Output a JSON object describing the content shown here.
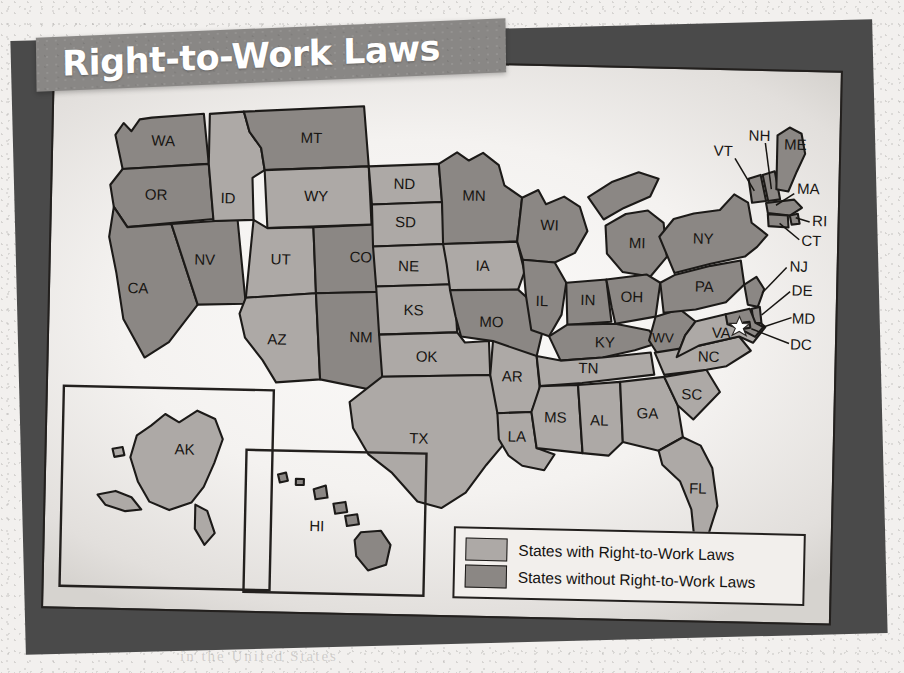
{
  "title": {
    "text": "Right-to-Work Laws"
  },
  "colors": {
    "with_rtw_fill": "#ada9a6",
    "without_rtw_fill": "#8b8784",
    "banner": "#898785",
    "outline": "#1c1a18",
    "page": "#f4f2f0",
    "shadow_sheet": "#4a4a4a"
  },
  "legend": {
    "items": [
      {
        "swatch": "with",
        "label": "States with Right-to-Work Laws"
      },
      {
        "swatch": "without",
        "label": "States without Right-to-Work Laws"
      }
    ]
  },
  "insets": {
    "alaska": {
      "label": "AK",
      "status": "with"
    },
    "hawaii": {
      "label": "HI",
      "status": "without"
    }
  },
  "map_data": {
    "type": "choropleth-categorical",
    "title": "Right-to-Work Laws",
    "region": "United States",
    "categories": [
      "States with Right-to-Work Laws",
      "States without Right-to-Work Laws"
    ],
    "marker": {
      "type": "star",
      "on_state": "VA",
      "note": "capital star near DC"
    },
    "states": [
      {
        "code": "WA",
        "status": "without"
      },
      {
        "code": "OR",
        "status": "without"
      },
      {
        "code": "CA",
        "status": "without"
      },
      {
        "code": "NV",
        "status": "without"
      },
      {
        "code": "ID",
        "status": "with"
      },
      {
        "code": "MT",
        "status": "without"
      },
      {
        "code": "WY",
        "status": "with"
      },
      {
        "code": "UT",
        "status": "with"
      },
      {
        "code": "AZ",
        "status": "with"
      },
      {
        "code": "CO",
        "status": "without"
      },
      {
        "code": "NM",
        "status": "without"
      },
      {
        "code": "ND",
        "status": "with"
      },
      {
        "code": "SD",
        "status": "with"
      },
      {
        "code": "NE",
        "status": "with"
      },
      {
        "code": "KS",
        "status": "with"
      },
      {
        "code": "OK",
        "status": "with"
      },
      {
        "code": "TX",
        "status": "with"
      },
      {
        "code": "MN",
        "status": "without"
      },
      {
        "code": "IA",
        "status": "with"
      },
      {
        "code": "MO",
        "status": "without"
      },
      {
        "code": "AR",
        "status": "with"
      },
      {
        "code": "LA",
        "status": "with"
      },
      {
        "code": "WI",
        "status": "without"
      },
      {
        "code": "IL",
        "status": "without"
      },
      {
        "code": "MI",
        "status": "without"
      },
      {
        "code": "IN",
        "status": "without"
      },
      {
        "code": "OH",
        "status": "without"
      },
      {
        "code": "KY",
        "status": "without"
      },
      {
        "code": "TN",
        "status": "with"
      },
      {
        "code": "MS",
        "status": "with"
      },
      {
        "code": "AL",
        "status": "with"
      },
      {
        "code": "GA",
        "status": "with"
      },
      {
        "code": "FL",
        "status": "with"
      },
      {
        "code": "SC",
        "status": "with"
      },
      {
        "code": "NC",
        "status": "with"
      },
      {
        "code": "VA",
        "status": "with"
      },
      {
        "code": "WV",
        "status": "without"
      },
      {
        "code": "PA",
        "status": "without"
      },
      {
        "code": "NY",
        "status": "without"
      },
      {
        "code": "VT",
        "status": "without"
      },
      {
        "code": "NH",
        "status": "without"
      },
      {
        "code": "ME",
        "status": "without"
      },
      {
        "code": "MA",
        "status": "without"
      },
      {
        "code": "RI",
        "status": "without"
      },
      {
        "code": "CT",
        "status": "without"
      },
      {
        "code": "NJ",
        "status": "without"
      },
      {
        "code": "DE",
        "status": "without"
      },
      {
        "code": "MD",
        "status": "without"
      },
      {
        "code": "DC",
        "status": "without"
      },
      {
        "code": "AK",
        "status": "with"
      },
      {
        "code": "HI",
        "status": "without"
      }
    ]
  },
  "labels": {
    "WA": "WA",
    "OR": "OR",
    "CA": "CA",
    "NV": "NV",
    "ID": "ID",
    "MT": "MT",
    "WY": "WY",
    "UT": "UT",
    "AZ": "AZ",
    "CO": "CO",
    "NM": "NM",
    "ND": "ND",
    "SD": "SD",
    "NE": "NE",
    "KS": "KS",
    "OK": "OK",
    "TX": "TX",
    "MN": "MN",
    "IA": "IA",
    "MO": "MO",
    "AR": "AR",
    "LA": "LA",
    "WI": "WI",
    "IL": "IL",
    "MI": "MI",
    "IN": "IN",
    "OH": "OH",
    "KY": "KY",
    "TN": "TN",
    "MS": "MS",
    "AL": "AL",
    "GA": "GA",
    "FL": "FL",
    "SC": "SC",
    "NC": "NC",
    "VA": "VA",
    "WV": "WV",
    "PA": "PA",
    "NY": "NY",
    "VT": "VT",
    "NH": "NH",
    "ME": "ME",
    "MA": "MA",
    "RI": "RI",
    "CT": "CT",
    "NJ": "NJ",
    "DE": "DE",
    "MD": "MD",
    "DC": "DC",
    "AK": "AK",
    "HI": "HI"
  },
  "background_ghost_text": {
    "line1": "the fundamental right of",
    "line2": "in the United States"
  }
}
